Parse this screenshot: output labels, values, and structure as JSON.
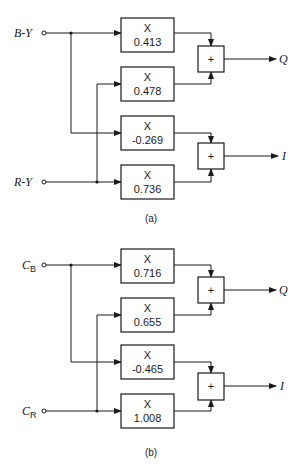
{
  "panels": [
    {
      "id": "a",
      "caption": "(a)",
      "inputs": [
        {
          "label": "B-Y"
        },
        {
          "label": "R-Y"
        }
      ],
      "multipliers": [
        {
          "op": "X",
          "value": "0.413"
        },
        {
          "op": "X",
          "value": "0.478"
        },
        {
          "op": "X",
          "value": "-0.269"
        },
        {
          "op": "X",
          "value": "0.736"
        }
      ],
      "adders": [
        {
          "op": "+",
          "output": "Q"
        },
        {
          "op": "+",
          "output": "I"
        }
      ]
    },
    {
      "id": "b",
      "caption": "(b)",
      "inputs": [
        {
          "label": "C",
          "sub": "B"
        },
        {
          "label": "C",
          "sub": "R"
        }
      ],
      "multipliers": [
        {
          "op": "X",
          "value": "0.716"
        },
        {
          "op": "X",
          "value": "0.655"
        },
        {
          "op": "X",
          "value": "-0.465"
        },
        {
          "op": "X",
          "value": "1.008"
        }
      ],
      "adders": [
        {
          "op": "+",
          "output": "Q"
        },
        {
          "op": "+",
          "output": "I"
        }
      ]
    }
  ],
  "colors": {
    "line": "#1a1a1a",
    "background": "#ffffff"
  }
}
